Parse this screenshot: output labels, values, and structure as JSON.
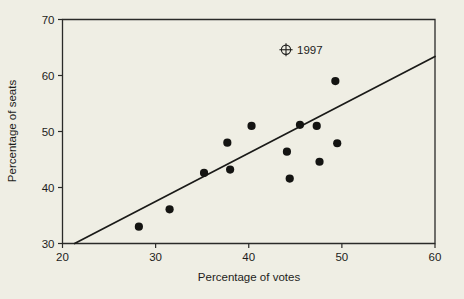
{
  "chart_data": {
    "type": "scatter",
    "title": "",
    "xlabel": "Percentage of votes",
    "ylabel": "Percentage of seats",
    "xlim": [
      20,
      60
    ],
    "ylim": [
      30,
      70
    ],
    "xticks": [
      20,
      30,
      40,
      50,
      60
    ],
    "yticks": [
      30,
      40,
      50,
      60,
      70
    ],
    "xtick_labels": [
      "20",
      "30",
      "40",
      "50",
      "60"
    ],
    "ytick_labels": [
      "30",
      "40",
      "50",
      "60",
      "70"
    ],
    "grid": false,
    "legend": false,
    "points": [
      {
        "x": 28.2,
        "y": 33.0
      },
      {
        "x": 31.5,
        "y": 36.1
      },
      {
        "x": 35.2,
        "y": 42.6
      },
      {
        "x": 37.7,
        "y": 48.0
      },
      {
        "x": 38.0,
        "y": 43.2
      },
      {
        "x": 40.3,
        "y": 51.0
      },
      {
        "x": 44.1,
        "y": 46.4
      },
      {
        "x": 44.4,
        "y": 41.6
      },
      {
        "x": 45.5,
        "y": 51.2
      },
      {
        "x": 47.3,
        "y": 51.0
      },
      {
        "x": 47.6,
        "y": 44.6
      },
      {
        "x": 49.3,
        "y": 59.0
      },
      {
        "x": 49.5,
        "y": 47.9
      }
    ],
    "fit_line": {
      "x0": 21.3,
      "y0": 30.0,
      "x1": 60.0,
      "y1": 63.4
    },
    "annotations": [
      {
        "marker": "crossed-circle-marker",
        "label": "1997",
        "x": 44.0,
        "y": 64.6
      }
    ]
  },
  "colors": {
    "background": "#efeee4",
    "ink": "#1d1d1b",
    "point": "#141412",
    "line": "#1a1a18"
  }
}
